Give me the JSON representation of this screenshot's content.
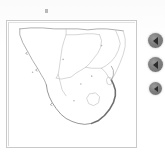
{
  "app": {
    "title": "Southern Africa Map Viewer",
    "background_color": "#fdfdfd",
    "width": 165,
    "height": 154
  },
  "map_panel": {
    "name": "map-panel",
    "border_color": "#c9c9c9",
    "fill_color": "#ffffff",
    "region": "Southern Africa",
    "outline_color": "#8a8a8a",
    "border_line_color": "#c0c0c0",
    "shaded_coast_color": "#6f6f6f",
    "countries": [
      {
        "name": "Namibia"
      },
      {
        "name": "Botswana"
      },
      {
        "name": "Zimbabwe"
      },
      {
        "name": "Mozambique"
      },
      {
        "name": "South Africa"
      },
      {
        "name": "Lesotho"
      },
      {
        "name": "Eswatini"
      }
    ],
    "markers": [
      {
        "name": "marker-namibia",
        "x": 26,
        "y": 52
      },
      {
        "name": "marker-botswana",
        "x": 57,
        "y": 39
      },
      {
        "name": "marker-zimbabwe",
        "x": 96,
        "y": 25
      },
      {
        "name": "marker-south-africa",
        "x": 75,
        "y": 64
      },
      {
        "name": "marker-eastern-cape",
        "x": 68,
        "y": 81
      },
      {
        "name": "marker-mpumalanga",
        "x": 86,
        "y": 56
      }
    ]
  },
  "top_tick": {
    "name": "top-tick-mark",
    "color": "#b9b9b9"
  },
  "arrow_buttons": {
    "fill_color": "#7e7e7e",
    "glyph_color": "#2b2b2b",
    "items": [
      {
        "name": "arrow-button-1",
        "icon": "triangle-left-icon",
        "label": ""
      },
      {
        "name": "arrow-button-2",
        "icon": "triangle-left-icon",
        "label": ""
      },
      {
        "name": "arrow-button-3",
        "icon": "triangle-left-icon",
        "label": ""
      }
    ]
  }
}
